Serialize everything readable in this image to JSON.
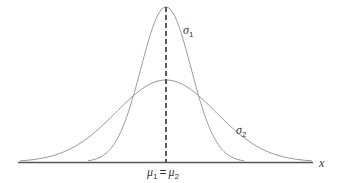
{
  "diagram": {
    "type": "normal-distributions-same-mean",
    "axis": {
      "label": "x",
      "color": "#555555"
    },
    "mean_line": {
      "style": "dashed",
      "color": "#222222"
    },
    "curves": [
      {
        "id": "sigma1",
        "label_symbol": "σ",
        "label_sub": "1",
        "description": "narrow, tall normal curve (smaller standard deviation)",
        "color": "#9a9a9a"
      },
      {
        "id": "sigma2",
        "label_symbol": "σ",
        "label_sub": "2",
        "description": "wide, flat normal curve (larger standard deviation)",
        "color": "#9a9a9a"
      }
    ],
    "mean_label": {
      "mu1_symbol": "μ",
      "mu1_sub": "1",
      "equals": "=",
      "mu2_symbol": "μ",
      "mu2_sub": "2"
    }
  }
}
